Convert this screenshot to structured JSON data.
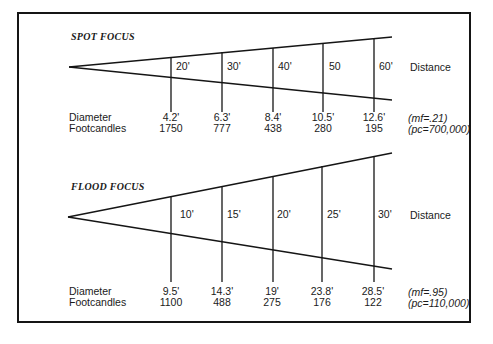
{
  "spot": {
    "title": "SPOT FOCUS",
    "distance_label": "Distance",
    "distances": [
      "20'",
      "30'",
      "40'",
      "50",
      "60'"
    ],
    "row_labels": {
      "diameter": "Diameter",
      "footcandles": "Footcandles"
    },
    "diameters": [
      "4.2'",
      "6.3'",
      "8.4'",
      "10.5'",
      "12.6'"
    ],
    "footcandles": [
      "1750",
      "777",
      "438",
      "280",
      "195"
    ],
    "mf": "(mf=.21)",
    "pc": "(pc=700,000)"
  },
  "flood": {
    "title": "FLOOD FOCUS",
    "distance_label": "Distance",
    "distances": [
      "10'",
      "15'",
      "20'",
      "25'",
      "30'"
    ],
    "row_labels": {
      "diameter": "Diameter",
      "footcandles": "Footcandles"
    },
    "diameters": [
      "9.5'",
      "14.3'",
      "19'",
      "23.8'",
      "28.5'"
    ],
    "footcandles": [
      "1100",
      "488",
      "275",
      "176",
      "122"
    ],
    "mf": "(mf=.95)",
    "pc": "(pc=110,000)"
  }
}
